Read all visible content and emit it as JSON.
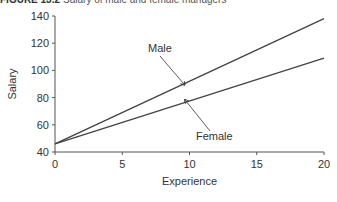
{
  "figure": {
    "number": "FIGURE 13.2",
    "caption": "Salary of male and female managers"
  },
  "chart_data": {
    "type": "line",
    "title": "Salary of male and female managers",
    "xlabel": "Experience",
    "ylabel": "Salary",
    "xlim": [
      0,
      20
    ],
    "ylim": [
      40,
      140
    ],
    "xticks": [
      0,
      5,
      10,
      15,
      20
    ],
    "yticks": [
      40,
      60,
      80,
      100,
      120,
      140
    ],
    "grid": false,
    "series": [
      {
        "name": "Male",
        "x": [
          0,
          20
        ],
        "y": [
          46,
          138
        ]
      },
      {
        "name": "Female",
        "x": [
          0,
          20
        ],
        "y": [
          46,
          109
        ]
      }
    ],
    "annotations": [
      {
        "text": "Male",
        "arrow_to": [
          9.5,
          90
        ]
      },
      {
        "text": "Female",
        "arrow_to": [
          9.5,
          80
        ]
      }
    ]
  }
}
